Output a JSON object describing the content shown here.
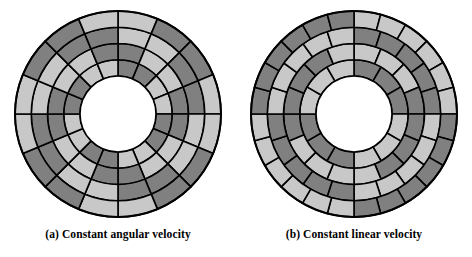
{
  "figure": {
    "background_color": "#ffffff",
    "stroke_color": "#000000",
    "dark_sector_color": "#808080",
    "light_sector_color": "#c8c8c8",
    "hub_color": "#ffffff"
  },
  "panels": [
    {
      "id": "cav",
      "caption": "(a) Constant angular velocity",
      "geometry": {
        "center_x": 106,
        "center_y": 106,
        "outer_radius": 103,
        "hub_radius": 38,
        "ring_count": 4,
        "ring_radii": [
          38,
          54.25,
          70.5,
          86.75,
          103
        ]
      },
      "chart_data": {
        "type": "pie",
        "title": "(a) Constant angular velocity",
        "layout": "constant-angular-velocity",
        "ring_count": 4,
        "sectors_per_ring": [
          16,
          16,
          16,
          16
        ],
        "angle_offset_deg": [
          0,
          0,
          0,
          0
        ],
        "note": "Every track holds the same number of sectors; radial boundaries align across all tracks.",
        "ring_patterns": [
          [
            1,
            1,
            0,
            0,
            1,
            1,
            0,
            0,
            1,
            1,
            0,
            0,
            1,
            1,
            0,
            0
          ],
          [
            1,
            0,
            0,
            1,
            1,
            0,
            0,
            1,
            1,
            0,
            0,
            1,
            1,
            0,
            0,
            1
          ],
          [
            0,
            0,
            1,
            1,
            0,
            0,
            1,
            1,
            0,
            0,
            1,
            1,
            0,
            0,
            1,
            1
          ],
          [
            0,
            1,
            1,
            0,
            0,
            1,
            1,
            0,
            0,
            1,
            1,
            0,
            0,
            1,
            1,
            0
          ]
        ],
        "palette": {
          "0": "#c8c8c8",
          "1": "#808080"
        }
      }
    },
    {
      "id": "clv",
      "caption": "(b) Constant linear velocity",
      "geometry": {
        "center_x": 106,
        "center_y": 106,
        "outer_radius": 103,
        "hub_radius": 38,
        "ring_count": 4,
        "ring_radii": [
          38,
          54.25,
          70.5,
          86.75,
          103
        ]
      },
      "chart_data": {
        "type": "pie",
        "title": "(b) Constant linear velocity",
        "layout": "constant-linear-velocity",
        "ring_count": 4,
        "sectors_per_ring": [
          12,
          16,
          20,
          24
        ],
        "angle_offset_deg": [
          0,
          0,
          0,
          0
        ],
        "note": "Outer tracks hold more sectors than inner tracks so that bit density stays constant.",
        "ring_patterns": [
          [
            1,
            1,
            1,
            0,
            0,
            0,
            1,
            1,
            1,
            0,
            0,
            0
          ],
          [
            0,
            0,
            0,
            1,
            1,
            1,
            1,
            0,
            0,
            0,
            0,
            1,
            1,
            1,
            1,
            0
          ],
          [
            1,
            1,
            1,
            1,
            1,
            0,
            0,
            0,
            0,
            0,
            1,
            1,
            1,
            1,
            1,
            0,
            0,
            0,
            0,
            0
          ],
          [
            0,
            0,
            0,
            0,
            0,
            0,
            1,
            1,
            1,
            1,
            1,
            1,
            0,
            0,
            0,
            0,
            0,
            0,
            1,
            1,
            1,
            1,
            1,
            1
          ]
        ],
        "palette": {
          "0": "#c8c8c8",
          "1": "#808080"
        }
      }
    }
  ]
}
